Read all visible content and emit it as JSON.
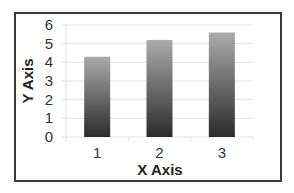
{
  "chart_data": {
    "type": "bar",
    "title": "",
    "xlabel": "X Axis",
    "ylabel": "Y Axis",
    "categories": [
      "1",
      "2",
      "3"
    ],
    "values": [
      4.3,
      5.2,
      5.6
    ],
    "ylim": [
      0,
      6
    ],
    "yticks": [
      "0",
      "1",
      "2",
      "3",
      "4",
      "5",
      "6"
    ],
    "grid": true,
    "legend": "none",
    "colors": {
      "bar_top": "#ababab",
      "bar_bottom": "#2b2b2b",
      "grid": "#e2e2e2",
      "border": "#3a3a3a"
    }
  }
}
